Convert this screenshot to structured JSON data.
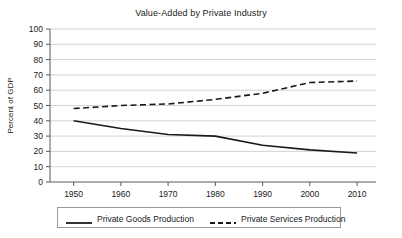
{
  "chart_data": {
    "type": "line",
    "title": "Value-Added by Private Industry",
    "xlabel": "",
    "ylabel": "Percent of GDP",
    "xlim": [
      1945,
      2014
    ],
    "ylim": [
      0,
      100
    ],
    "grid": true,
    "legend_position": "bottom",
    "xticks": [
      "1950",
      "1960",
      "1970",
      "1980",
      "1990",
      "2000",
      "2010"
    ],
    "xtick_values": [
      1950,
      1960,
      1970,
      1980,
      1990,
      2000,
      2010
    ],
    "yticks": [
      "0",
      "10",
      "20",
      "30",
      "40",
      "50",
      "60",
      "70",
      "80",
      "90",
      "100"
    ],
    "ytick_values": [
      0,
      10,
      20,
      30,
      40,
      50,
      60,
      70,
      80,
      90,
      100
    ],
    "x": [
      1950,
      1960,
      1970,
      1980,
      1990,
      2000,
      2010
    ],
    "series": [
      {
        "name": "Private Goods Production",
        "style": "solid",
        "color": "#1a1a1a",
        "values": [
          40,
          35,
          31,
          30,
          24,
          21,
          19
        ]
      },
      {
        "name": "Private Services Production",
        "style": "dashed",
        "color": "#1a1a1a",
        "values": [
          48,
          50,
          51,
          54,
          58,
          65,
          66
        ]
      }
    ]
  },
  "legend": {
    "items": [
      {
        "label": "Private Goods Production",
        "style": "solid"
      },
      {
        "label": "Private Services Production",
        "style": "dashed"
      }
    ]
  }
}
